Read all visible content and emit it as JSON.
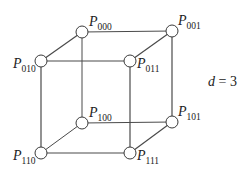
{
  "diagram": {
    "dimension_label": {
      "var": "d",
      "eq": " = ",
      "value": "3"
    },
    "node_radius": 6,
    "colors": {
      "edge": "#4a4a4a",
      "node_fill": "#ffffff",
      "node_stroke": "#3a3a3a",
      "text": "#222222"
    },
    "nodes": [
      {
        "id": "000",
        "letter": "P",
        "sub": "000",
        "x": 82,
        "y": 32,
        "lx": 89,
        "ly": 26,
        "anchor": "start"
      },
      {
        "id": "001",
        "letter": "P",
        "sub": "001",
        "x": 172,
        "y": 31,
        "lx": 178,
        "ly": 25,
        "anchor": "start"
      },
      {
        "id": "010",
        "letter": "P",
        "sub": "010",
        "x": 41,
        "y": 61,
        "lx": 13,
        "ly": 68,
        "anchor": "start"
      },
      {
        "id": "011",
        "letter": "P",
        "sub": "011",
        "x": 130,
        "y": 61,
        "lx": 137,
        "ly": 68,
        "anchor": "start"
      },
      {
        "id": "100",
        "letter": "P",
        "sub": "100",
        "x": 82,
        "y": 123,
        "lx": 89,
        "ly": 117,
        "anchor": "start"
      },
      {
        "id": "101",
        "letter": "P",
        "sub": "101",
        "x": 172,
        "y": 122,
        "lx": 178,
        "ly": 116,
        "anchor": "start"
      },
      {
        "id": "110",
        "letter": "P",
        "sub": "110",
        "x": 41,
        "y": 153,
        "lx": 13,
        "ly": 160,
        "anchor": "start"
      },
      {
        "id": "111",
        "letter": "P",
        "sub": "111",
        "x": 130,
        "y": 153,
        "lx": 137,
        "ly": 160,
        "anchor": "start"
      }
    ],
    "edges": [
      {
        "from": "000",
        "to": "001",
        "front": false
      },
      {
        "from": "000",
        "to": "010",
        "front": true
      },
      {
        "from": "000",
        "to": "100",
        "front": false
      },
      {
        "from": "001",
        "to": "011",
        "front": true
      },
      {
        "from": "001",
        "to": "101",
        "front": true
      },
      {
        "from": "010",
        "to": "011",
        "front": true
      },
      {
        "from": "010",
        "to": "110",
        "front": true
      },
      {
        "from": "011",
        "to": "111",
        "front": true
      },
      {
        "from": "100",
        "to": "101",
        "front": false
      },
      {
        "from": "100",
        "to": "110",
        "front": false
      },
      {
        "from": "101",
        "to": "111",
        "front": true
      },
      {
        "from": "110",
        "to": "111",
        "front": true
      }
    ]
  }
}
